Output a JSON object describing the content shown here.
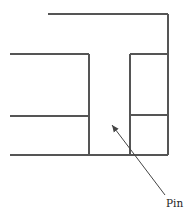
{
  "diagram": {
    "type": "mechanical-joint-cross-section",
    "line_color": "#555555",
    "labels": [
      {
        "id": "pin",
        "text": "Pin",
        "x": 166,
        "y": 207
      }
    ],
    "lines": [
      {
        "id": "top-plate-top",
        "x1": 48,
        "y1": 14,
        "x2": 168,
        "y2": 14
      },
      {
        "id": "right-outer-edge",
        "x1": 168,
        "y1": 14,
        "x2": 168,
        "y2": 155
      },
      {
        "id": "right-block-top",
        "x1": 130,
        "y1": 54,
        "x2": 168,
        "y2": 54
      },
      {
        "id": "right-block-mid",
        "x1": 130,
        "y1": 115,
        "x2": 168,
        "y2": 115
      },
      {
        "id": "pin-right-edge",
        "x1": 130,
        "y1": 54,
        "x2": 130,
        "y2": 155
      },
      {
        "id": "left-plate-top",
        "x1": 10,
        "y1": 54,
        "x2": 89,
        "y2": 54
      },
      {
        "id": "pin-left-edge",
        "x1": 89,
        "y1": 54,
        "x2": 89,
        "y2": 155
      },
      {
        "id": "left-plate-mid",
        "x1": 10,
        "y1": 116,
        "x2": 89,
        "y2": 116
      },
      {
        "id": "bottom-edge",
        "x1": 10,
        "y1": 155,
        "x2": 168,
        "y2": 155
      }
    ],
    "leader": {
      "from": [
        165,
        195
      ],
      "to": [
        112,
        125
      ],
      "target": "pin"
    }
  }
}
